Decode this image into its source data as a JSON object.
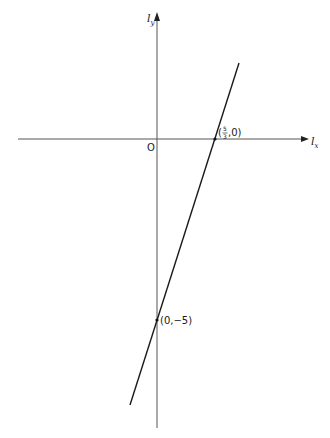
{
  "diagram": {
    "type": "coordinate-plane-line",
    "axes": {
      "x_label_main": "l",
      "x_label_sub": "x",
      "y_label_main": "l",
      "y_label_sub": "y",
      "origin_label": "O"
    },
    "line": {
      "description": "straight line crossing both axes",
      "equation_implied": "l_y = 3 l_x - 5"
    },
    "points": [
      {
        "name": "x-intercept",
        "label_open": "(",
        "frac_num": "5",
        "frac_den": "3",
        "label_rest": ",0)"
      },
      {
        "name": "y-intercept",
        "label": "(0,−5)"
      }
    ],
    "colors": {
      "axis": "#3a3a3a",
      "line": "#1a1a1a",
      "text": "#1a1a1a",
      "background": "#ffffff"
    }
  }
}
